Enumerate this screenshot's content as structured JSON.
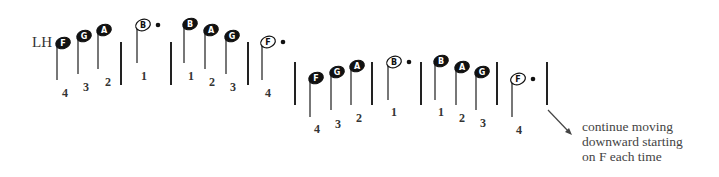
{
  "hand_label": "LH",
  "colors": {
    "ink": "#222222",
    "note_fill": "#111111",
    "note_text_on_fill": "#ffffff",
    "stem": "#555555"
  },
  "notes": [
    {
      "letter": "F",
      "filled": true,
      "x": 63,
      "y": 43,
      "stem_bottom": 80,
      "finger": "4",
      "fx": 65,
      "fy": 98
    },
    {
      "letter": "G",
      "filled": true,
      "x": 84,
      "y": 36,
      "stem_bottom": 74,
      "finger": "3",
      "fx": 86,
      "fy": 92
    },
    {
      "letter": "A",
      "filled": true,
      "x": 104,
      "y": 30,
      "stem_bottom": 69,
      "finger": "2",
      "fx": 108,
      "fy": 87
    },
    {
      "letter": "B",
      "filled": false,
      "x": 143,
      "y": 25,
      "stem_bottom": 63,
      "finger": "1",
      "fx": 144,
      "fy": 81,
      "dot": true
    },
    {
      "letter": "B",
      "filled": true,
      "x": 190,
      "y": 24,
      "stem_bottom": 63,
      "finger": "1",
      "fx": 191,
      "fy": 81
    },
    {
      "letter": "A",
      "filled": true,
      "x": 211,
      "y": 30,
      "stem_bottom": 69,
      "finger": "2",
      "fx": 212,
      "fy": 87
    },
    {
      "letter": "G",
      "filled": true,
      "x": 232,
      "y": 36,
      "stem_bottom": 74,
      "finger": "3",
      "fx": 233,
      "fy": 92
    },
    {
      "letter": "F",
      "filled": false,
      "x": 268,
      "y": 42,
      "stem_bottom": 80,
      "finger": "4",
      "fx": 268,
      "fy": 98,
      "dot": true
    },
    {
      "letter": "F",
      "filled": true,
      "x": 316,
      "y": 78,
      "stem_bottom": 117,
      "finger": "4",
      "fx": 317,
      "fy": 134
    },
    {
      "letter": "G",
      "filled": true,
      "x": 337,
      "y": 72,
      "stem_bottom": 110,
      "finger": "3",
      "fx": 338,
      "fy": 129
    },
    {
      "letter": "A",
      "filled": true,
      "x": 357,
      "y": 66,
      "stem_bottom": 105,
      "finger": "2",
      "fx": 359,
      "fy": 123
    },
    {
      "letter": "B",
      "filled": false,
      "x": 394,
      "y": 62,
      "stem_bottom": 100,
      "finger": "1",
      "fx": 394,
      "fy": 117,
      "dot": true
    },
    {
      "letter": "B",
      "filled": true,
      "x": 441,
      "y": 61,
      "stem_bottom": 100,
      "finger": "1",
      "fx": 441,
      "fy": 117
    },
    {
      "letter": "A",
      "filled": true,
      "x": 462,
      "y": 67,
      "stem_bottom": 105,
      "finger": "2",
      "fx": 462,
      "fy": 123
    },
    {
      "letter": "G",
      "filled": true,
      "x": 482,
      "y": 72,
      "stem_bottom": 110,
      "finger": "3",
      "fx": 483,
      "fy": 128
    },
    {
      "letter": "F",
      "filled": false,
      "x": 518,
      "y": 79,
      "stem_bottom": 117,
      "finger": "4",
      "fx": 519,
      "fy": 135,
      "dot": true
    }
  ],
  "barlines": [
    {
      "x": 121,
      "top": 42,
      "bottom": 85
    },
    {
      "x": 171,
      "top": 42,
      "bottom": 85
    },
    {
      "x": 248,
      "top": 42,
      "bottom": 85
    },
    {
      "x": 295,
      "top": 62,
      "bottom": 105
    },
    {
      "x": 372,
      "top": 62,
      "bottom": 105
    },
    {
      "x": 421,
      "top": 62,
      "bottom": 105
    },
    {
      "x": 497,
      "top": 62,
      "bottom": 105
    },
    {
      "x": 547,
      "top": 62,
      "bottom": 105
    }
  ],
  "arrow": {
    "x1": 548,
    "y1": 110,
    "x2": 572,
    "y2": 135
  },
  "caption": {
    "line1": "continue moving",
    "line2": "downward starting",
    "line3": "on F each time"
  }
}
